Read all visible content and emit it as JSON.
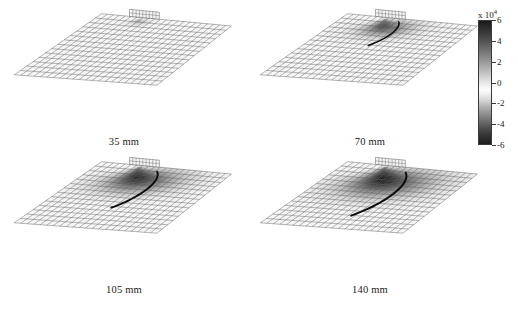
{
  "figure": {
    "type": "multi-panel-surface-plot",
    "background_color": "#ffffff",
    "panel_count": 4,
    "layout": "2x2"
  },
  "chart_data": {
    "type": "heatmap",
    "title": "",
    "xlabel": "",
    "ylabel": "",
    "colormap": "grayscale",
    "shared_colorbar": true,
    "colorbar": {
      "exponent_label": "x 10",
      "exponent_value": "4",
      "ticks": [
        6,
        4,
        2,
        0,
        -2,
        -4,
        -6
      ],
      "tick_labels": [
        "6",
        "4",
        "2",
        "0",
        "-2",
        "-4",
        "-6"
      ],
      "vmin": -6,
      "vmax": 6,
      "scale_factor": 10000,
      "orientation": "vertical",
      "position": "right",
      "dark_high": "#1b1b1b",
      "light_mid": "#fcfcfc",
      "dark_low": "#1e1e1e"
    },
    "panels": [
      {
        "label": "35 mm",
        "distance_mm": 35,
        "grid_cols": 22,
        "grid_rows": 14,
        "disturbance_extent": 0.1,
        "disturbance_depth": 0.18,
        "crack_visible": false,
        "notch_visible": true,
        "description": "Nearly undisturbed mesh with small notch at top edge"
      },
      {
        "label": "70 mm",
        "distance_mm": 70,
        "grid_cols": 22,
        "grid_rows": 14,
        "disturbance_extent": 0.34,
        "disturbance_depth": 0.62,
        "crack_visible": true,
        "notch_visible": true,
        "description": "Dark lobe forming with sharp curved crack line"
      },
      {
        "label": "105 mm",
        "distance_mm": 105,
        "grid_cols": 22,
        "grid_rows": 14,
        "disturbance_extent": 0.52,
        "disturbance_depth": 0.88,
        "crack_visible": true,
        "notch_visible": true,
        "description": "Large dark crescent lobe with pronounced crack"
      },
      {
        "label": "140 mm",
        "distance_mm": 140,
        "grid_cols": 22,
        "grid_rows": 14,
        "disturbance_extent": 0.62,
        "disturbance_depth": 1.0,
        "crack_visible": true,
        "notch_visible": true,
        "description": "Largest dark crescent lobe spanning most of surface"
      }
    ]
  }
}
